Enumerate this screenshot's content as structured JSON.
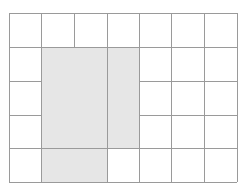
{
  "diagram": {
    "type": "grid",
    "columns": 7,
    "rows": 5,
    "x_lines": [
      9,
      41,
      74,
      107,
      139,
      171,
      204,
      237
    ],
    "y_lines": [
      13,
      47,
      81,
      115,
      148,
      182
    ],
    "line_color": "#9a9a9a",
    "fill_color": "#e6e6e6",
    "background": "#ffffff",
    "shaded_region": {
      "description": "L-shaped region covering columns 1-3 of rows 1-3 and columns 1-2 of row 4 (0-indexed)",
      "cells": [
        [
          1,
          1
        ],
        [
          2,
          1
        ],
        [
          3,
          1
        ],
        [
          1,
          2
        ],
        [
          2,
          2
        ],
        [
          3,
          2
        ],
        [
          1,
          3
        ],
        [
          2,
          3
        ],
        [
          3,
          3
        ],
        [
          1,
          4
        ],
        [
          2,
          4
        ]
      ]
    },
    "interior_lines_in_shaded": {
      "vertical_x107_from_row": 1,
      "vertical_x107_to_row": 4,
      "horizontal_y148_cols": [
        1,
        3
      ]
    }
  }
}
